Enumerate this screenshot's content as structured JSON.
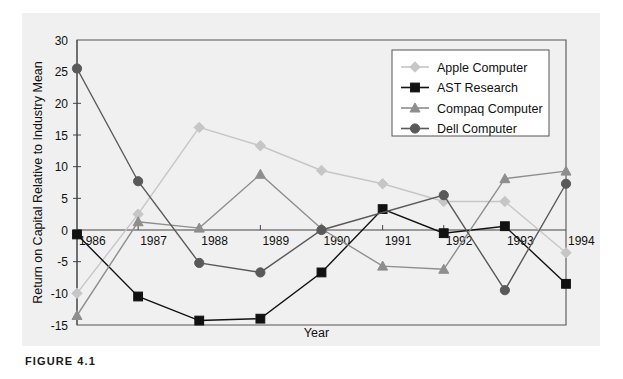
{
  "figure": {
    "caption": "FIGURE 4.1"
  },
  "chart_data": {
    "type": "line",
    "title": "",
    "xlabel": "Year",
    "ylabel": "Return on Capital Relative to Industry Mean",
    "categories": [
      "1986",
      "1987",
      "1988",
      "1989",
      "1990",
      "1991",
      "1992",
      "1993",
      "1994"
    ],
    "x": [
      1986,
      1987,
      1988,
      1989,
      1990,
      1991,
      1992,
      1993,
      1994
    ],
    "xlim": [
      1986,
      1994
    ],
    "ylim": [
      -15,
      30
    ],
    "yticks": [
      "30",
      "25",
      "20",
      "15",
      "10",
      "5",
      "0",
      "-5",
      "-10",
      "-15"
    ],
    "ytick_values": [
      30,
      25,
      20,
      15,
      10,
      5,
      0,
      -5,
      -10,
      -15
    ],
    "grid": false,
    "legend_position": "top-right",
    "series": [
      {
        "name": "Apple Computer",
        "color": "#c6c6c6",
        "marker": "diamond",
        "values": [
          -10.0,
          2.5,
          16.2,
          13.3,
          9.4,
          7.3,
          4.5,
          4.5,
          -3.6
        ]
      },
      {
        "name": "AST Research",
        "color": "#111111",
        "marker": "square",
        "values": [
          -0.7,
          -10.5,
          -14.3,
          -14.0,
          -6.7,
          3.3,
          -0.5,
          0.6,
          -8.5
        ]
      },
      {
        "name": "Compaq Computer",
        "color": "#8e8e8e",
        "marker": "triangle",
        "values": [
          -13.5,
          1.3,
          0.3,
          8.8,
          0.2,
          -5.7,
          -6.2,
          8.1,
          9.3
        ]
      },
      {
        "name": "Dell Computer",
        "color": "#595959",
        "marker": "circle",
        "values": [
          25.5,
          7.7,
          -5.2,
          -6.7,
          0.0,
          null,
          5.5,
          -9.5,
          7.3
        ]
      }
    ]
  }
}
